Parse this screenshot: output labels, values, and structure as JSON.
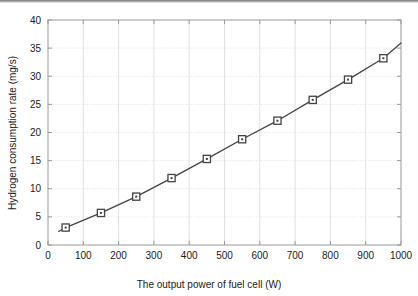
{
  "chart_data": {
    "type": "line",
    "title": "",
    "xlabel": "The output power of fuel cell (W)",
    "ylabel": "Hydrogen consumption rate (mg/s)",
    "xlim": [
      0,
      1000
    ],
    "ylim": [
      0,
      40
    ],
    "xticks": [
      0,
      100,
      200,
      300,
      400,
      500,
      600,
      700,
      800,
      900,
      1000
    ],
    "yticks": [
      0,
      5,
      10,
      15,
      20,
      25,
      30,
      35,
      40
    ],
    "xtick_labels": [
      "0",
      "100",
      "200",
      "300",
      "400",
      "500",
      "600",
      "700",
      "800",
      "900",
      "1000"
    ],
    "ytick_labels": [
      "0",
      "5",
      "10",
      "15",
      "20",
      "25",
      "30",
      "35",
      "40"
    ],
    "grid": true,
    "legend": "none",
    "marker": "open-square",
    "line_color": "#444444",
    "marker_color": "#444444",
    "grid_color": "#d9d9d9",
    "axis_color": "#9a9a9a",
    "x": [
      50,
      150,
      250,
      350,
      450,
      550,
      650,
      750,
      850,
      950
    ],
    "values": [
      3.1,
      5.7,
      8.6,
      11.9,
      15.3,
      18.8,
      22.1,
      25.8,
      29.4,
      33.2
    ],
    "series": [
      {
        "name": "Hydrogen consumption rate",
        "x": [
          50,
          150,
          250,
          350,
          450,
          550,
          650,
          750,
          850,
          950
        ],
        "values": [
          3.1,
          5.7,
          8.6,
          11.9,
          15.3,
          18.8,
          22.1,
          25.8,
          29.4,
          33.2
        ]
      }
    ],
    "line_extension": {
      "start": [
        30,
        2.4
      ],
      "end": [
        1000,
        35.9
      ]
    }
  }
}
